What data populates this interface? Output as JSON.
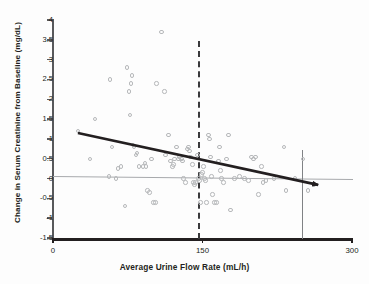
{
  "chart_data": {
    "type": "scatter",
    "title": "",
    "xlabel": "Average Urine Flow Rate (mL/h)",
    "ylabel": "Change in Serum Creatinine from Baseline (mg/dL)",
    "xlim": [
      0,
      300
    ],
    "ylim": [
      -1.5,
      4
    ],
    "xticks": [
      0,
      150,
      300
    ],
    "xtick_labels": [
      "0",
      "150",
      "300"
    ],
    "yticks": [
      -1.5,
      -1,
      -0.5,
      0,
      0.5,
      1,
      1.5,
      2,
      2.5,
      3,
      3.5,
      4
    ],
    "ytick_labels": [
      "-1.5",
      "-1",
      "-0.5",
      "0",
      "0.5",
      "1",
      "1.5",
      "2",
      "2.5",
      "3",
      "3.5",
      "4"
    ],
    "grid": false,
    "legend": false,
    "marker": {
      "style": "open-circle",
      "color": "#b6b8ba",
      "size": 4.4
    },
    "points": [
      [
        25,
        1.2
      ],
      [
        42,
        1.5
      ],
      [
        37,
        0.5
      ],
      [
        57,
        2.5
      ],
      [
        59,
        0.8
      ],
      [
        56,
        0.05
      ],
      [
        63,
        0.0
      ],
      [
        65,
        0.25
      ],
      [
        68,
        0.3
      ],
      [
        72,
        -0.7
      ],
      [
        74,
        2.8
      ],
      [
        76,
        2.2
      ],
      [
        78,
        2.4
      ],
      [
        79,
        2.6
      ],
      [
        77,
        1.6
      ],
      [
        80,
        0.85
      ],
      [
        81,
        0.8
      ],
      [
        83,
        0.6
      ],
      [
        84,
        0.65
      ],
      [
        86,
        0.3
      ],
      [
        90,
        0.3
      ],
      [
        92,
        0.4
      ],
      [
        93,
        0.3
      ],
      [
        95,
        -0.3
      ],
      [
        97,
        -0.35
      ],
      [
        99,
        0.5
      ],
      [
        101,
        -0.6
      ],
      [
        103,
        -0.6
      ],
      [
        104,
        2.4
      ],
      [
        109,
        3.7
      ],
      [
        112,
        2.2
      ],
      [
        113,
        0.6
      ],
      [
        116,
        1.1
      ],
      [
        118,
        0.45
      ],
      [
        120,
        0.3
      ],
      [
        121,
        0.35
      ],
      [
        122,
        0.5
      ],
      [
        124,
        0.8
      ],
      [
        126,
        0.5
      ],
      [
        127,
        0.55
      ],
      [
        129,
        0.5
      ],
      [
        130,
        0.45
      ],
      [
        131,
        0.0
      ],
      [
        133,
        -0.1
      ],
      [
        135,
        0.75
      ],
      [
        136,
        0.8
      ],
      [
        137,
        0.7
      ],
      [
        138,
        0.55
      ],
      [
        140,
        0.35
      ],
      [
        141,
        -0.1
      ],
      [
        142,
        -0.15
      ],
      [
        143,
        -0.1
      ],
      [
        145,
        0.6
      ],
      [
        146,
        0.0
      ],
      [
        147,
        -0.05
      ],
      [
        148,
        -0.6
      ],
      [
        149,
        0.1
      ],
      [
        150,
        0.15
      ],
      [
        151,
        0.3
      ],
      [
        152,
        0.0
      ],
      [
        153,
        -0.05
      ],
      [
        154,
        -0.6
      ],
      [
        156,
        1.1
      ],
      [
        157,
        1.0
      ],
      [
        158,
        0.55
      ],
      [
        159,
        0.05
      ],
      [
        160,
        -0.4
      ],
      [
        162,
        -0.6
      ],
      [
        164,
        -0.6
      ],
      [
        166,
        0.45
      ],
      [
        167,
        0.8
      ],
      [
        168,
        0.2
      ],
      [
        169,
        0.0
      ],
      [
        171,
        -0.1
      ],
      [
        174,
        0.5
      ],
      [
        176,
        1.1
      ],
      [
        178,
        -0.8
      ],
      [
        182,
        0.0
      ],
      [
        187,
        0.05
      ],
      [
        192,
        0.0
      ],
      [
        196,
        -0.05
      ],
      [
        199,
        0.55
      ],
      [
        201,
        0.5
      ],
      [
        203,
        0.55
      ],
      [
        206,
        -0.4
      ],
      [
        209,
        0.3
      ],
      [
        211,
        -0.1
      ],
      [
        214,
        -0.05
      ],
      [
        222,
        0.0
      ],
      [
        232,
        0.8
      ],
      [
        234,
        -0.3
      ],
      [
        243,
        0.0
      ],
      [
        251,
        0.5
      ],
      [
        256,
        -0.3
      ],
      [
        262,
        -0.15
      ]
    ],
    "trend_line": {
      "label": "regression-trend-line",
      "x_start": 25,
      "y_start": 1.15,
      "x_end": 266,
      "y_end": -0.16,
      "slope": -0.0054,
      "color": "#231f20",
      "arrow": true
    },
    "reference_lines": [
      {
        "name": "zero-reference-line",
        "orientation": "horizontal",
        "value": 0,
        "color": "#a7a9ac",
        "style": "solid"
      },
      {
        "name": "threshold-line-150",
        "orientation": "vertical",
        "value": 150,
        "color": "#3a3a3c",
        "style": "dashed"
      },
      {
        "name": "marker-line-250",
        "orientation": "vertical",
        "value": 250,
        "color": "#808285",
        "style": "solid"
      }
    ]
  }
}
